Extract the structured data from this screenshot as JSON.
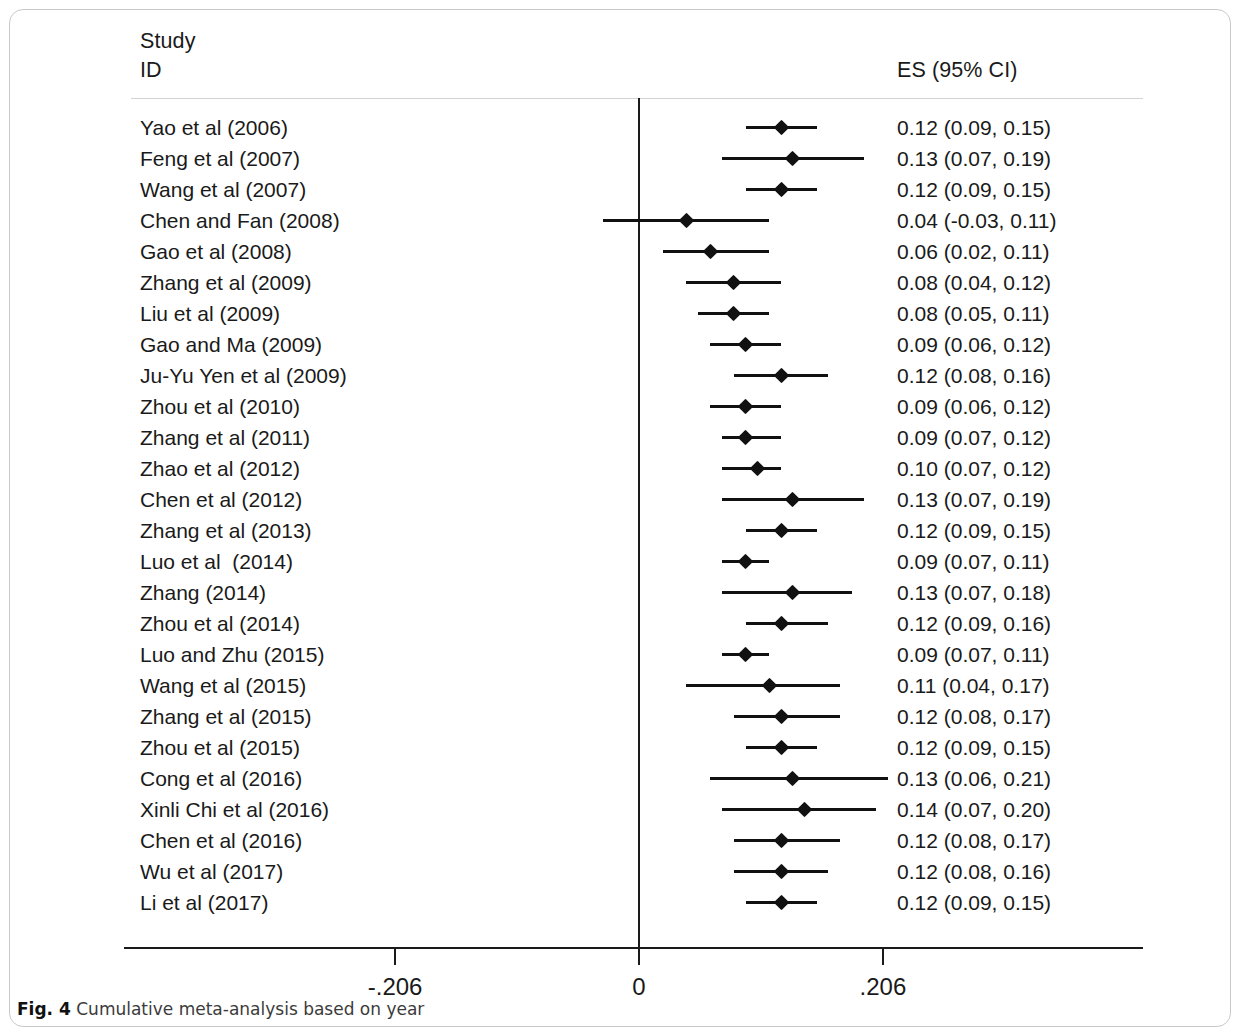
{
  "figure": {
    "caption_label": "Fig. 4",
    "caption_text": "Cumulative meta-analysis based on year",
    "header_study": "Study\nID",
    "header_es": "ES (95% CI)"
  },
  "axis": {
    "tick_labels": [
      "-.206",
      "0",
      ".206"
    ],
    "tick_values": [
      -0.206,
      0,
      0.206
    ]
  },
  "chart_data": {
    "type": "forest",
    "title": "Cumulative meta-analysis based on year",
    "xlabel": "",
    "ylabel": "",
    "xlim": [
      -0.206,
      0.206
    ],
    "xticks": [
      -0.206,
      0,
      0.206
    ],
    "xtick_labels": [
      "-.206",
      "0",
      ".206"
    ],
    "grid": false,
    "legend": "none",
    "null_line": 0,
    "columns": [
      "Study ID",
      "ES (95% CI)"
    ],
    "rows": [
      {
        "label": "Yao et al (2006)",
        "es": 0.12,
        "lo": 0.09,
        "hi": 0.15,
        "es_text": "0.12 (0.09, 0.15)"
      },
      {
        "label": "Feng et al (2007)",
        "es": 0.13,
        "lo": 0.07,
        "hi": 0.19,
        "es_text": "0.13 (0.07, 0.19)"
      },
      {
        "label": "Wang et al (2007)",
        "es": 0.12,
        "lo": 0.09,
        "hi": 0.15,
        "es_text": "0.12 (0.09, 0.15)"
      },
      {
        "label": "Chen and Fan (2008)",
        "es": 0.04,
        "lo": -0.03,
        "hi": 0.11,
        "es_text": "0.04 (-0.03, 0.11)"
      },
      {
        "label": "Gao et al (2008)",
        "es": 0.06,
        "lo": 0.02,
        "hi": 0.11,
        "es_text": "0.06 (0.02, 0.11)"
      },
      {
        "label": "Zhang et al (2009)",
        "es": 0.08,
        "lo": 0.04,
        "hi": 0.12,
        "es_text": "0.08 (0.04, 0.12)"
      },
      {
        "label": "Liu et al (2009)",
        "es": 0.08,
        "lo": 0.05,
        "hi": 0.11,
        "es_text": "0.08 (0.05, 0.11)"
      },
      {
        "label": "Gao and Ma (2009)",
        "es": 0.09,
        "lo": 0.06,
        "hi": 0.12,
        "es_text": "0.09 (0.06, 0.12)"
      },
      {
        "label": "Ju-Yu Yen et al (2009)",
        "es": 0.12,
        "lo": 0.08,
        "hi": 0.16,
        "es_text": "0.12 (0.08, 0.16)"
      },
      {
        "label": "Zhou et al (2010)",
        "es": 0.09,
        "lo": 0.06,
        "hi": 0.12,
        "es_text": "0.09 (0.06, 0.12)"
      },
      {
        "label": "Zhang et al (2011)",
        "es": 0.09,
        "lo": 0.07,
        "hi": 0.12,
        "es_text": "0.09 (0.07, 0.12)"
      },
      {
        "label": "Zhao et al (2012)",
        "es": 0.1,
        "lo": 0.07,
        "hi": 0.12,
        "es_text": "0.10 (0.07, 0.12)"
      },
      {
        "label": "Chen et al (2012)",
        "es": 0.13,
        "lo": 0.07,
        "hi": 0.19,
        "es_text": "0.13 (0.07, 0.19)"
      },
      {
        "label": "Zhang et al (2013)",
        "es": 0.12,
        "lo": 0.09,
        "hi": 0.15,
        "es_text": "0.12 (0.09, 0.15)"
      },
      {
        "label": "Luo et al  (2014)",
        "es": 0.09,
        "lo": 0.07,
        "hi": 0.11,
        "es_text": "0.09 (0.07, 0.11)"
      },
      {
        "label": "Zhang (2014)",
        "es": 0.13,
        "lo": 0.07,
        "hi": 0.18,
        "es_text": "0.13 (0.07, 0.18)"
      },
      {
        "label": "Zhou et al (2014)",
        "es": 0.12,
        "lo": 0.09,
        "hi": 0.16,
        "es_text": "0.12 (0.09, 0.16)"
      },
      {
        "label": "Luo and Zhu (2015)",
        "es": 0.09,
        "lo": 0.07,
        "hi": 0.11,
        "es_text": "0.09 (0.07, 0.11)"
      },
      {
        "label": "Wang et al (2015)",
        "es": 0.11,
        "lo": 0.04,
        "hi": 0.17,
        "es_text": "0.11 (0.04, 0.17)"
      },
      {
        "label": "Zhang et al (2015)",
        "es": 0.12,
        "lo": 0.08,
        "hi": 0.17,
        "es_text": "0.12 (0.08, 0.17)"
      },
      {
        "label": "Zhou et al (2015)",
        "es": 0.12,
        "lo": 0.09,
        "hi": 0.15,
        "es_text": "0.12 (0.09, 0.15)"
      },
      {
        "label": "Cong et al (2016)",
        "es": 0.13,
        "lo": 0.06,
        "hi": 0.21,
        "es_text": "0.13 (0.06, 0.21)"
      },
      {
        "label": "Xinli Chi et al (2016)",
        "es": 0.14,
        "lo": 0.07,
        "hi": 0.2,
        "es_text": "0.14 (0.07, 0.20)"
      },
      {
        "label": "Chen et al (2016)",
        "es": 0.12,
        "lo": 0.08,
        "hi": 0.17,
        "es_text": "0.12 (0.08, 0.17)"
      },
      {
        "label": "Wu et al (2017)",
        "es": 0.12,
        "lo": 0.08,
        "hi": 0.16,
        "es_text": "0.12 (0.08, 0.16)"
      },
      {
        "label": "Li et al (2017)",
        "es": 0.12,
        "lo": 0.09,
        "hi": 0.15,
        "es_text": "0.12 (0.09, 0.15)"
      }
    ]
  }
}
